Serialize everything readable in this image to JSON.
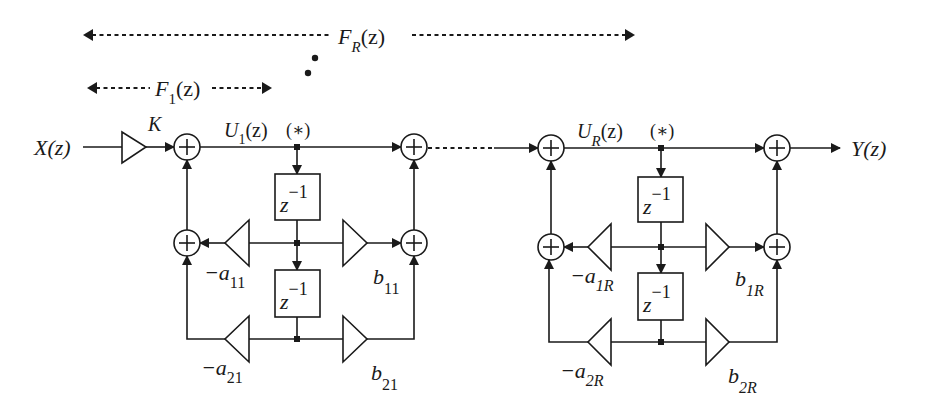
{
  "diagram": {
    "type": "cascaded second-order IIR filter block diagram",
    "span_labels": {
      "full": {
        "base": "F",
        "sub": "R",
        "arg": "(z)"
      },
      "stage1": {
        "base": "F",
        "sub": "1",
        "arg": "(z)"
      }
    },
    "input_label": "X(z)",
    "output_label": "Y(z)",
    "gain_label": "K",
    "ellipsis": "⋰",
    "stages": [
      {
        "node_label": {
          "base": "U",
          "sub": "1",
          "arg": "(z)"
        },
        "star": "(∗)",
        "delay1": {
          "base": "z",
          "exp": "−1"
        },
        "delay2": {
          "base": "z",
          "exp": "−1"
        },
        "a1": {
          "base": "−a",
          "sub": "11"
        },
        "a2": {
          "base": "−a",
          "sub": "21"
        },
        "b1": {
          "base": "b",
          "sub": "11"
        },
        "b2": {
          "base": "b",
          "sub": "21"
        }
      },
      {
        "node_label": {
          "base": "U",
          "sub": "R",
          "arg": "(z)"
        },
        "star": "(∗)",
        "delay1": {
          "base": "z",
          "exp": "−1"
        },
        "delay2": {
          "base": "z",
          "exp": "−1"
        },
        "a1": {
          "base": "−a",
          "sub": "1R"
        },
        "a2": {
          "base": "−a",
          "sub": "2R"
        },
        "b1": {
          "base": "b",
          "sub": "1R"
        },
        "b2": {
          "base": "b",
          "sub": "2R"
        }
      }
    ],
    "adder_symbol": "+"
  }
}
